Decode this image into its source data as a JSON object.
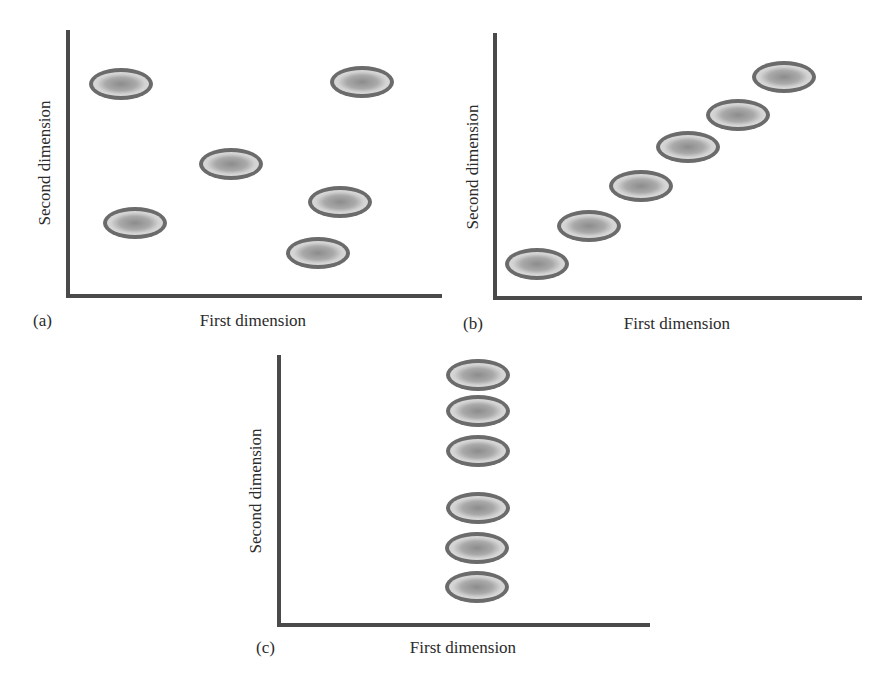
{
  "figure": {
    "panels": [
      {
        "id": "a",
        "panel_label": "(a)",
        "xlabel": "First dimension",
        "ylabel": "Second dimension",
        "pattern": "scattered / no correlation",
        "axes": {
          "x0": 68,
          "y0": 296,
          "x1": 440,
          "ytop": 32
        },
        "points": [
          {
            "cx": 121,
            "cy": 84
          },
          {
            "cx": 362,
            "cy": 82
          },
          {
            "cx": 231,
            "cy": 164
          },
          {
            "cx": 340,
            "cy": 202
          },
          {
            "cx": 135,
            "cy": 223
          },
          {
            "cx": 318,
            "cy": 253
          }
        ],
        "label_pos": {
          "panel": [
            33,
            326
          ],
          "xlabel": [
            253,
            326
          ],
          "ylabel": [
            50,
            163
          ]
        }
      },
      {
        "id": "b",
        "panel_label": "(b)",
        "xlabel": "First dimension",
        "ylabel": "Second dimension",
        "pattern": "diagonal / both dimensions",
        "axes": {
          "x0": 495,
          "y0": 298,
          "x1": 860,
          "ytop": 35
        },
        "points": [
          {
            "cx": 537,
            "cy": 264
          },
          {
            "cx": 589,
            "cy": 226
          },
          {
            "cx": 641,
            "cy": 186
          },
          {
            "cx": 688,
            "cy": 147
          },
          {
            "cx": 738,
            "cy": 115
          },
          {
            "cx": 784,
            "cy": 77
          }
        ],
        "label_pos": {
          "panel": [
            463,
            329
          ],
          "xlabel": [
            677,
            329
          ],
          "ylabel": [
            478,
            167
          ]
        }
      },
      {
        "id": "c",
        "panel_label": "(c)",
        "xlabel": "First dimension",
        "ylabel": "Second dimension",
        "pattern": "vertical / second dimension only",
        "axes": {
          "x0": 279,
          "y0": 625,
          "x1": 648,
          "ytop": 357
        },
        "points": [
          {
            "cx": 478,
            "cy": 375
          },
          {
            "cx": 478,
            "cy": 411
          },
          {
            "cx": 478,
            "cy": 451
          },
          {
            "cx": 478,
            "cy": 508
          },
          {
            "cx": 477,
            "cy": 548
          },
          {
            "cx": 477,
            "cy": 587
          }
        ],
        "label_pos": {
          "panel": [
            256,
            653
          ],
          "xlabel": [
            463,
            653
          ],
          "ylabel": [
            261,
            491
          ]
        }
      }
    ],
    "marker": {
      "rx": 32,
      "ry": 16,
      "ring_color": "#6b6b6b",
      "fill_outer": "#cfcfcf",
      "fill_inner": "#8f8f8f"
    },
    "colors": {
      "axis": "#4a4a4a",
      "text": "#2b2b2b",
      "background": "#ffffff"
    }
  }
}
